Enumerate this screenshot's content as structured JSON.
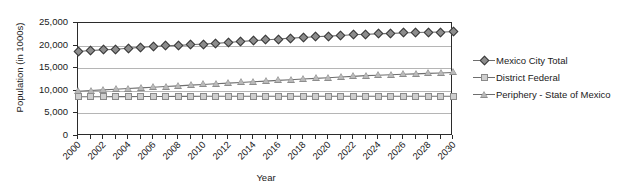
{
  "chart_data": {
    "type": "line",
    "title": "",
    "xlabel": "Year",
    "ylabel": "Population (in 1000s)",
    "xlim": [
      2000,
      2030
    ],
    "ylim": [
      0,
      25000
    ],
    "ytick_labels": [
      "25,000",
      "20,000",
      "15,000",
      "10,000",
      "5,000",
      "0"
    ],
    "ytick_values": [
      25000,
      20000,
      15000,
      10000,
      5000,
      0
    ],
    "xtick_labels": [
      "2000",
      "2002",
      "2004",
      "2006",
      "2008",
      "2010",
      "2012",
      "2014",
      "2016",
      "2018",
      "2020",
      "2022",
      "2024",
      "2026",
      "2028",
      "2030"
    ],
    "grid": true,
    "legend_position": "right",
    "x": [
      2000,
      2001,
      2002,
      2003,
      2004,
      2005,
      2006,
      2007,
      2008,
      2009,
      2010,
      2011,
      2012,
      2013,
      2014,
      2015,
      2016,
      2017,
      2018,
      2019,
      2020,
      2021,
      2022,
      2023,
      2024,
      2025,
      2026,
      2027,
      2028,
      2029,
      2030
    ],
    "series": [
      {
        "name": "Mexico City Total",
        "marker": "diamond",
        "values": [
          18700,
          18900,
          19050,
          19200,
          19400,
          19600,
          19800,
          19950,
          20050,
          20200,
          20350,
          20500,
          20700,
          20900,
          21100,
          21250,
          21450,
          21650,
          21800,
          21950,
          22100,
          22250,
          22400,
          22500,
          22600,
          22700,
          22800,
          22900,
          22950,
          23000,
          23050
        ]
      },
      {
        "name": "District Federal",
        "marker": "square",
        "values": [
          8700,
          8700,
          8700,
          8710,
          8720,
          8730,
          8740,
          8750,
          8760,
          8770,
          8780,
          8790,
          8800,
          8800,
          8800,
          8800,
          8800,
          8800,
          8800,
          8800,
          8800,
          8800,
          8800,
          8800,
          8800,
          8800,
          8800,
          8800,
          8800,
          8800,
          8800
        ]
      },
      {
        "name": "Periphery - State of Mexico",
        "marker": "triangle",
        "values": [
          9900,
          10050,
          10200,
          10350,
          10500,
          10650,
          10800,
          10950,
          11100,
          11250,
          11400,
          11550,
          11700,
          11850,
          12000,
          12150,
          12300,
          12450,
          12600,
          12750,
          12900,
          13050,
          13200,
          13350,
          13450,
          13550,
          13650,
          13750,
          13850,
          13950,
          14050
        ]
      }
    ],
    "colors": {
      "series_line": "#6e6e6e",
      "marker_fill_dark": "#8d8d8d",
      "marker_fill_light": "#cfcfcf",
      "axis": "#2b2b2b",
      "gridline": "#b5b5b5",
      "background": "#ffffff"
    }
  }
}
